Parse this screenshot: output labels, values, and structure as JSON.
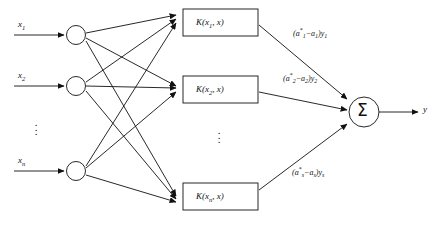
{
  "diagram": {
    "stroke_color": "#111111",
    "background_color": "#ffffff",
    "inputs": [
      {
        "label": "x",
        "sub": "1",
        "node_name": "input-node-1"
      },
      {
        "label": "x",
        "sub": "2",
        "node_name": "input-node-2"
      },
      {
        "label": "x",
        "sub": "n",
        "node_name": "input-node-n"
      }
    ],
    "input_ellipsis": "⋮",
    "kernels": [
      {
        "text": "K(x",
        "sub": "1",
        "tail": ", x)"
      },
      {
        "text": "K(x",
        "sub": "2",
        "tail": ", x)"
      },
      {
        "text": "K(x",
        "sub": "n",
        "tail": ", x)"
      }
    ],
    "kernel_ellipsis": "⋮",
    "weights": [
      {
        "open": "(a",
        "sup": "*",
        "sub1": "1",
        "minus": "−a",
        "sub2": "1",
        "close": ")y",
        "sub3": "1"
      },
      {
        "open": "(a",
        "sup": "*",
        "sub1": "2",
        "minus": "−a",
        "sub2": "2",
        "close": ")y",
        "sub3": "2"
      },
      {
        "open": "(a",
        "sup": "*",
        "sub1": "s",
        "minus": "−a",
        "sub2": "s",
        "close": ")y",
        "sub3": "s"
      }
    ],
    "summation": {
      "symbol": "Σ",
      "name": "summation-node"
    },
    "output": {
      "label": "y"
    }
  }
}
